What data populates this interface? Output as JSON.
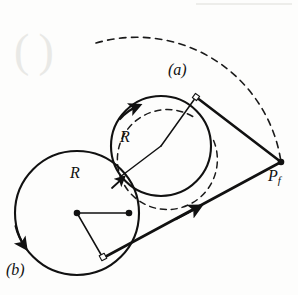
{
  "figure": {
    "background_color": "#fdfdfc",
    "ink_color": "#111111",
    "labels": {
      "arc_a": "(a)",
      "arc_b": "(b)",
      "radius_upper": "R",
      "radius_lower": "R",
      "final_point": "P",
      "final_point_sub": "f"
    },
    "geometry": {
      "circle_a": {
        "cx": 161,
        "cy": 146,
        "r": 50,
        "style": "solid",
        "stroke_width": 2.1
      },
      "circle_b": {
        "cx": 77,
        "cy": 213,
        "r": 62,
        "style": "solid",
        "stroke_width": 2.1
      },
      "dashed_circle": {
        "cx": 164,
        "cy": 157,
        "r": 50,
        "style": "dashed",
        "stroke_width": 1.5
      },
      "dashed_arc_large": {
        "cx": 182,
        "cy": 168,
        "r": 146,
        "style": "dashed",
        "stroke_width": 1.5
      },
      "final_point": {
        "x": 281,
        "y": 162
      },
      "center_a": {
        "x": 161,
        "y": 146
      },
      "center_b": {
        "x": 77,
        "y": 213
      },
      "tangent_point_upper": {
        "x": 196,
        "y": 97
      },
      "tangent_point_lower": {
        "x": 103,
        "y": 258
      },
      "switch_point": {
        "x": 129,
        "y": 213
      },
      "upper_tangent_line": {
        "x1": 196,
        "y1": 97,
        "x2": 281,
        "y2": 162
      },
      "lower_tangent_line": {
        "x1": 103,
        "y1": 258,
        "x2": 281,
        "y2": 162
      },
      "radius_upper_line": {
        "x1": 161,
        "y1": 146,
        "x2": 196,
        "y2": 97
      },
      "radius_lower_line": {
        "x1": 77,
        "y1": 213,
        "x2": 103,
        "y2": 258
      },
      "chord_centers": {
        "x1": 77,
        "y1": 213,
        "x2": 129,
        "y2": 213
      }
    },
    "markers": {
      "arrow_on_circle_a": {
        "x": 128,
        "y": 112,
        "label": "ccw-direction-arrow"
      },
      "arrow_on_circle_b": {
        "x": 21,
        "y": 240,
        "label": "cw-direction-arrow"
      },
      "arrow_on_lower_line": {
        "x": 193,
        "y": 211,
        "label": "travel-direction-arrow"
      },
      "right_angle_upper": {
        "x": 196,
        "y": 97
      },
      "right_angle_lower": {
        "x": 103,
        "y": 257
      }
    }
  }
}
